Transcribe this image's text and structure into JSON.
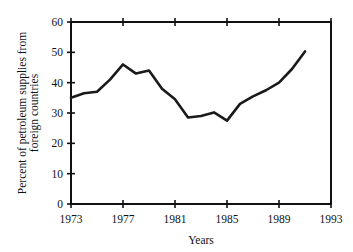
{
  "chart_data": {
    "type": "line",
    "title": "",
    "xlabel": "Years",
    "ylabel": "Percent of petroleum supplies from foreign countries",
    "ylabel_line1": "Percent of petroleum supplies from",
    "ylabel_line2": "foreign countries",
    "xlim": [
      1973,
      1993
    ],
    "ylim": [
      0,
      60
    ],
    "xticks": [
      1973,
      1977,
      1981,
      1985,
      1989,
      1993
    ],
    "yticks": [
      0,
      10,
      20,
      30,
      40,
      50,
      60
    ],
    "xtick_labels": [
      "1973",
      "1977",
      "1981",
      "1985",
      "1989",
      "1993"
    ],
    "ytick_labels": [
      "0",
      "10",
      "20",
      "30",
      "40",
      "50",
      "60"
    ],
    "grid": false,
    "legend": false,
    "line_color": "#1a1a1a",
    "axis_color": "#111111",
    "background_color": "#ffffff",
    "x": [
      1973,
      1974,
      1975,
      1976,
      1977,
      1978,
      1979,
      1980,
      1981,
      1982,
      1983,
      1984,
      1985,
      1986,
      1987,
      1988,
      1989,
      1990,
      1991
    ],
    "values": [
      35,
      36.5,
      37,
      41,
      46,
      43,
      44,
      38,
      34.5,
      28.5,
      29,
      30.2,
      27.5,
      33,
      35.5,
      37.5,
      40,
      44.5,
      50.3
    ],
    "series": [
      {
        "name": "Percent of petroleum supplies from foreign countries",
        "values": [
          35,
          36.5,
          37,
          41,
          46,
          43,
          44,
          38,
          34.5,
          28.5,
          29,
          30.2,
          27.5,
          33,
          35.5,
          37.5,
          40,
          44.5,
          50.3
        ]
      }
    ]
  }
}
